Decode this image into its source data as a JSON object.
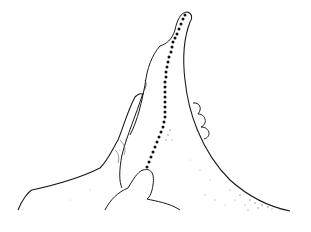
{
  "image": {
    "description": "Line sketch of a hand supporting a foot/finger with a dotted line running along its length",
    "width": 311,
    "height": 232,
    "colors": {
      "background": "#ffffff",
      "outline": "#1a1a1a",
      "shading": "#6a6a6a",
      "dots": "#111111"
    },
    "dotted_line": {
      "points": [
        [
          185,
          15
        ],
        [
          183,
          19
        ],
        [
          181,
          24
        ],
        [
          179,
          29
        ],
        [
          177,
          34
        ],
        [
          175,
          38
        ],
        [
          173,
          42
        ],
        [
          172,
          47
        ],
        [
          171,
          52
        ],
        [
          169,
          57
        ],
        [
          168,
          62
        ],
        [
          167,
          67
        ],
        [
          166,
          72
        ],
        [
          166,
          77
        ],
        [
          165,
          82
        ],
        [
          165,
          87
        ],
        [
          165,
          92
        ],
        [
          165,
          97
        ],
        [
          165,
          102
        ],
        [
          165,
          107
        ],
        [
          165,
          112
        ],
        [
          165,
          117
        ],
        [
          164,
          122
        ],
        [
          163,
          127
        ],
        [
          161,
          132
        ],
        [
          159,
          137
        ],
        [
          157,
          142
        ],
        [
          155,
          147
        ],
        [
          153,
          152
        ],
        [
          151,
          157
        ],
        [
          149,
          162
        ],
        [
          147,
          167
        ]
      ]
    }
  }
}
